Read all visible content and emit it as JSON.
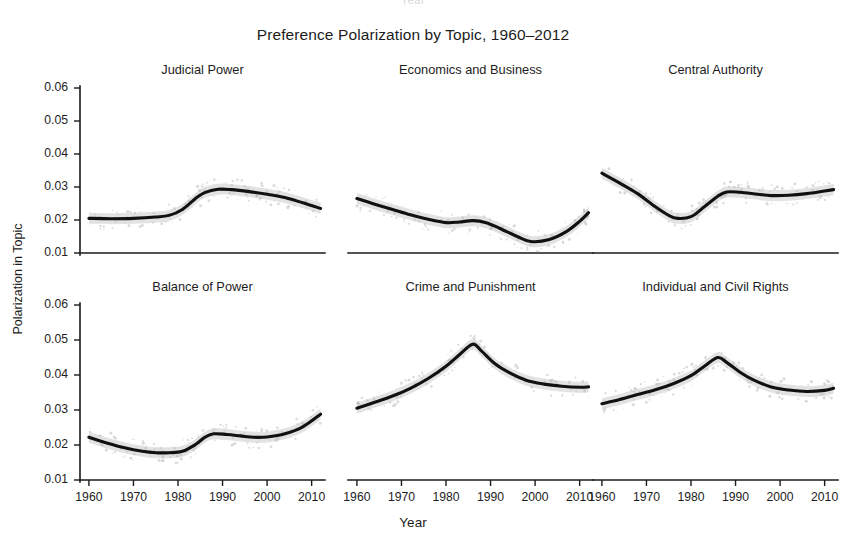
{
  "figure": {
    "title": "Preference Polarization by Topic, 1960–2012",
    "xlabel": "Year",
    "ylabel": "Polarization in Topic",
    "crop_artifact": "Year"
  },
  "axes": {
    "ytick_labels": [
      "0.06",
      "0.05",
      "0.04",
      "0.03",
      "0.02",
      "0.01"
    ],
    "xtick_labels": [
      "1960",
      "1970",
      "1980",
      "1990",
      "2000",
      "2010"
    ]
  },
  "chart_data": {
    "type": "line",
    "title": "Preference Polarization by Topic, 1960–2012",
    "xlabel": "Year",
    "ylabel": "Polarization in Topic",
    "xlim": [
      1958,
      2013
    ],
    "ylim": [
      0.01,
      0.06
    ],
    "yticks": [
      0.01,
      0.02,
      0.03,
      0.04,
      0.05,
      0.06
    ],
    "xticks": [
      1960,
      1970,
      1980,
      1990,
      2000,
      2010
    ],
    "grid": false,
    "legend": "none",
    "layout": {
      "rows": 2,
      "cols": 3
    },
    "panels": [
      {
        "title": "Judicial Power",
        "row": 0,
        "col": 0,
        "x": [
          1960,
          1965,
          1970,
          1975,
          1978,
          1981,
          1984,
          1986,
          1989,
          1992,
          1996,
          2000,
          2004,
          2008,
          2012
        ],
        "y": [
          0.0205,
          0.0204,
          0.0205,
          0.0209,
          0.0214,
          0.0232,
          0.0266,
          0.0283,
          0.0293,
          0.0292,
          0.0286,
          0.0278,
          0.0268,
          0.0252,
          0.0235
        ]
      },
      {
        "title": "Economics and Business",
        "row": 0,
        "col": 1,
        "x": [
          1960,
          1964,
          1968,
          1972,
          1976,
          1980,
          1983,
          1986,
          1989,
          1992,
          1996,
          1999,
          2003,
          2007,
          2010,
          2012
        ],
        "y": [
          0.0265,
          0.0248,
          0.0232,
          0.0216,
          0.0202,
          0.0192,
          0.0194,
          0.0198,
          0.0192,
          0.0175,
          0.015,
          0.0135,
          0.014,
          0.0165,
          0.0196,
          0.0222
        ]
      },
      {
        "title": "Central Authority",
        "row": 0,
        "col": 2,
        "x": [
          1960,
          1964,
          1968,
          1972,
          1975,
          1977,
          1980,
          1983,
          1986,
          1988,
          1991,
          1995,
          1998,
          2002,
          2006,
          2010,
          2012
        ],
        "y": [
          0.0342,
          0.0312,
          0.028,
          0.024,
          0.0214,
          0.0205,
          0.021,
          0.024,
          0.0272,
          0.0285,
          0.0284,
          0.0278,
          0.0274,
          0.0275,
          0.028,
          0.0288,
          0.0292
        ]
      },
      {
        "title": "Balance of Power",
        "row": 1,
        "col": 0,
        "x": [
          1960,
          1964,
          1968,
          1972,
          1975,
          1978,
          1981,
          1984,
          1986,
          1988,
          1991,
          1994,
          1997,
          2000,
          2004,
          2008,
          2012
        ],
        "y": [
          0.0222,
          0.0206,
          0.0192,
          0.0182,
          0.0178,
          0.0178,
          0.0182,
          0.0202,
          0.0222,
          0.0232,
          0.023,
          0.0226,
          0.0222,
          0.0223,
          0.0232,
          0.0252,
          0.0288
        ]
      },
      {
        "title": "Crime and Punishment",
        "row": 1,
        "col": 1,
        "x": [
          1960,
          1964,
          1968,
          1972,
          1976,
          1980,
          1983,
          1986,
          1988,
          1991,
          1994,
          1998,
          2002,
          2006,
          2010,
          2012
        ],
        "y": [
          0.0305,
          0.0322,
          0.034,
          0.0362,
          0.039,
          0.0425,
          0.0458,
          0.0488,
          0.0468,
          0.0432,
          0.0408,
          0.0385,
          0.0374,
          0.0368,
          0.0365,
          0.0366
        ]
      },
      {
        "title": "Individual and Civil Rights",
        "row": 1,
        "col": 2,
        "x": [
          1960,
          1964,
          1968,
          1972,
          1976,
          1980,
          1983,
          1986,
          1988,
          1991,
          1994,
          1998,
          2002,
          2006,
          2010,
          2012
        ],
        "y": [
          0.0318,
          0.033,
          0.0344,
          0.0358,
          0.0375,
          0.0398,
          0.0425,
          0.045,
          0.0436,
          0.0408,
          0.0386,
          0.0366,
          0.0357,
          0.0353,
          0.0356,
          0.0362
        ]
      }
    ]
  }
}
